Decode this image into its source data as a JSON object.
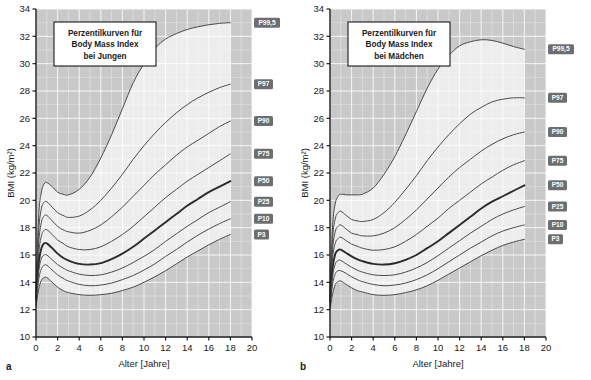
{
  "figure": {
    "panels": [
      {
        "letter": "a",
        "title_lines": [
          "Perzentilkurven für",
          "Body Mass Index",
          "bei Jungen"
        ],
        "xlabel": "Alter  [Jahre]",
        "ylabel": "BMI (kg/m²)",
        "xticks": [
          "0",
          "2",
          "4",
          "6",
          "8",
          "10",
          "12",
          "14",
          "16",
          "18",
          "20"
        ],
        "yticks": [
          "10",
          "12",
          "14",
          "16",
          "18",
          "20",
          "22",
          "24",
          "26",
          "28",
          "30",
          "32",
          "34"
        ]
      },
      {
        "letter": "b",
        "title_lines": [
          "Perzentilkurven für",
          "Body Mass Index",
          "bei Mädchen"
        ],
        "xlabel": "Alter  [Jahre]",
        "ylabel": "BMI (kg/m²)",
        "xticks": [
          "0",
          "2",
          "4",
          "6",
          "8",
          "10",
          "12",
          "14",
          "16",
          "18",
          "20"
        ],
        "yticks": [
          "10",
          "12",
          "14",
          "16",
          "18",
          "20",
          "22",
          "24",
          "26",
          "28",
          "30",
          "32",
          "34"
        ]
      }
    ],
    "colors": {
      "outside_band": "#c9c9c9",
      "inside_band": "#ededed",
      "gridline": "#ffffff",
      "curve": "#4a4a4a",
      "median_curve": "#2b2b2b",
      "label_badge": "#6e6e6e",
      "label_text": "#ffffff",
      "axis": "#1a1a1a"
    }
  },
  "chart_data": [
    {
      "type": "line",
      "title": "Perzentilkurven für Body Mass Index bei Jungen",
      "xlabel": "Alter [Jahre]",
      "ylabel": "BMI (kg/m²)",
      "xlim": [
        0,
        20
      ],
      "ylim": [
        10,
        34
      ],
      "grid": true,
      "legend": "inline-right-badges",
      "x": [
        0,
        0.25,
        0.5,
        0.75,
        1,
        1.5,
        2,
        2.5,
        3,
        4,
        5,
        6,
        7,
        8,
        9,
        10,
        11,
        12,
        13,
        14,
        15,
        16,
        17,
        18
      ],
      "series": [
        {
          "name": "P99,5",
          "values": [
            13.6,
            18.9,
            20.6,
            21.2,
            21.3,
            21.0,
            20.6,
            20.45,
            20.4,
            20.8,
            21.7,
            23.1,
            24.8,
            26.7,
            28.6,
            30.0,
            31.1,
            31.8,
            32.2,
            32.5,
            32.7,
            32.85,
            32.95,
            33.0
          ]
        },
        {
          "name": "P97",
          "values": [
            13.4,
            17.8,
            19.4,
            19.85,
            19.9,
            19.5,
            19.1,
            18.9,
            18.75,
            18.85,
            19.3,
            20.0,
            20.9,
            21.9,
            23.0,
            24.0,
            24.9,
            25.7,
            26.4,
            27.0,
            27.5,
            27.9,
            28.25,
            28.5
          ]
        },
        {
          "name": "P90",
          "values": [
            13.2,
            16.9,
            18.4,
            18.85,
            18.9,
            18.5,
            18.1,
            17.85,
            17.7,
            17.6,
            17.8,
            18.2,
            18.8,
            19.5,
            20.3,
            21.1,
            21.9,
            22.6,
            23.3,
            23.9,
            24.4,
            24.9,
            25.4,
            25.8
          ]
        },
        {
          "name": "P75",
          "values": [
            13.0,
            16.1,
            17.4,
            17.8,
            17.85,
            17.5,
            17.1,
            16.85,
            16.6,
            16.4,
            16.4,
            16.6,
            17.0,
            17.5,
            18.1,
            18.8,
            19.5,
            20.2,
            20.8,
            21.4,
            21.9,
            22.4,
            22.9,
            23.4
          ]
        },
        {
          "name": "P50",
          "values": [
            12.8,
            15.4,
            16.5,
            16.85,
            16.85,
            16.5,
            16.1,
            15.8,
            15.6,
            15.35,
            15.3,
            15.4,
            15.7,
            16.1,
            16.6,
            17.2,
            17.8,
            18.4,
            19.0,
            19.6,
            20.1,
            20.6,
            21.0,
            21.4
          ]
        },
        {
          "name": "P25",
          "values": [
            12.6,
            14.8,
            15.75,
            16.0,
            16.0,
            15.65,
            15.3,
            15.05,
            14.85,
            14.6,
            14.5,
            14.55,
            14.75,
            15.05,
            15.45,
            15.9,
            16.4,
            17.0,
            17.55,
            18.1,
            18.6,
            19.1,
            19.5,
            19.9
          ]
        },
        {
          "name": "P10",
          "values": [
            12.4,
            14.2,
            15.0,
            15.25,
            15.25,
            14.9,
            14.55,
            14.3,
            14.1,
            13.85,
            13.75,
            13.8,
            13.95,
            14.2,
            14.5,
            14.9,
            15.35,
            15.9,
            16.4,
            16.95,
            17.45,
            17.9,
            18.3,
            18.65
          ]
        },
        {
          "name": "P3",
          "values": [
            12.2,
            13.5,
            14.15,
            14.35,
            14.35,
            14.0,
            13.65,
            13.4,
            13.25,
            13.1,
            13.05,
            13.1,
            13.2,
            13.4,
            13.65,
            14.0,
            14.4,
            14.85,
            15.35,
            15.85,
            16.3,
            16.75,
            17.15,
            17.5
          ]
        }
      ]
    },
    {
      "type": "line",
      "title": "Perzentilkurven für Body Mass Index bei Mädchen",
      "xlabel": "Alter [Jahre]",
      "ylabel": "BMI (kg/m²)",
      "xlim": [
        0,
        20
      ],
      "ylim": [
        10,
        34
      ],
      "grid": true,
      "legend": "inline-right-badges",
      "x": [
        0,
        0.25,
        0.5,
        0.75,
        1,
        1.5,
        2,
        2.5,
        3,
        4,
        5,
        6,
        7,
        8,
        9,
        10,
        11,
        12,
        13,
        14,
        15,
        16,
        17,
        18
      ],
      "series": [
        {
          "name": "P99,5",
          "values": [
            13.4,
            18.2,
            19.8,
            20.3,
            20.45,
            20.4,
            20.4,
            20.4,
            20.45,
            20.9,
            21.9,
            23.2,
            24.8,
            26.5,
            28.2,
            29.6,
            30.6,
            31.3,
            31.6,
            31.75,
            31.7,
            31.5,
            31.25,
            31.05
          ]
        },
        {
          "name": "P97",
          "values": [
            13.2,
            17.3,
            18.7,
            19.1,
            19.2,
            18.9,
            18.6,
            18.5,
            18.45,
            18.6,
            19.1,
            19.85,
            20.8,
            21.8,
            22.9,
            23.9,
            24.8,
            25.6,
            26.3,
            26.8,
            27.2,
            27.4,
            27.5,
            27.5
          ]
        },
        {
          "name": "P90",
          "values": [
            13.0,
            16.5,
            17.75,
            18.1,
            18.2,
            17.9,
            17.6,
            17.5,
            17.4,
            17.4,
            17.6,
            18.0,
            18.6,
            19.3,
            20.1,
            20.9,
            21.7,
            22.4,
            23.0,
            23.6,
            24.1,
            24.5,
            24.8,
            25.0
          ]
        },
        {
          "name": "P75",
          "values": [
            12.8,
            15.8,
            16.9,
            17.2,
            17.3,
            17.05,
            16.8,
            16.65,
            16.5,
            16.35,
            16.4,
            16.6,
            17.0,
            17.5,
            18.1,
            18.7,
            19.4,
            20.0,
            20.6,
            21.2,
            21.7,
            22.2,
            22.6,
            22.9
          ]
        },
        {
          "name": "P50",
          "values": [
            12.6,
            15.1,
            16.1,
            16.35,
            16.4,
            16.15,
            15.9,
            15.7,
            15.55,
            15.35,
            15.3,
            15.4,
            15.65,
            16.0,
            16.5,
            17.0,
            17.6,
            18.2,
            18.8,
            19.4,
            19.9,
            20.3,
            20.7,
            21.1
          ]
        },
        {
          "name": "P25",
          "values": [
            12.4,
            14.5,
            15.35,
            15.6,
            15.6,
            15.35,
            15.1,
            14.9,
            14.75,
            14.55,
            14.5,
            14.55,
            14.75,
            15.05,
            15.45,
            15.95,
            16.5,
            17.05,
            17.6,
            18.1,
            18.6,
            19.0,
            19.3,
            19.55
          ]
        },
        {
          "name": "P10",
          "values": [
            12.2,
            13.9,
            14.65,
            14.85,
            14.85,
            14.65,
            14.4,
            14.2,
            14.05,
            13.85,
            13.75,
            13.8,
            13.95,
            14.2,
            14.55,
            15.0,
            15.5,
            16.0,
            16.5,
            16.95,
            17.4,
            17.75,
            18.0,
            18.2
          ]
        },
        {
          "name": "P3",
          "values": [
            12.0,
            13.2,
            13.85,
            14.05,
            14.1,
            13.85,
            13.6,
            13.4,
            13.3,
            13.1,
            13.05,
            13.1,
            13.25,
            13.45,
            13.75,
            14.15,
            14.6,
            15.05,
            15.5,
            15.95,
            16.35,
            16.7,
            16.95,
            17.15
          ]
        }
      ]
    }
  ]
}
